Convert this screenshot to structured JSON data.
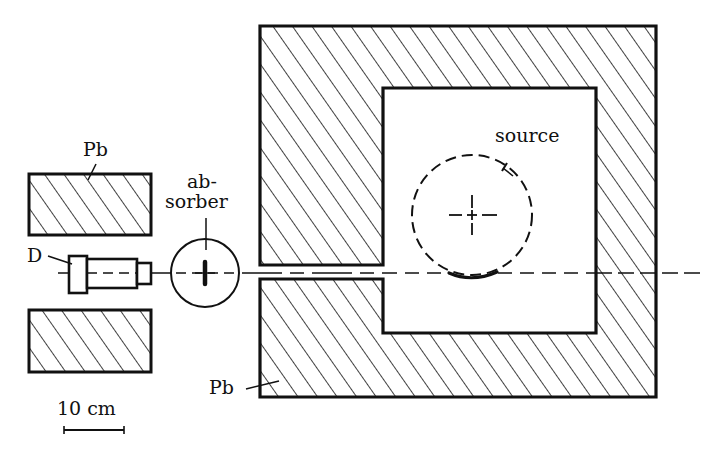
{
  "diagram": {
    "colors": {
      "ink": "#111111",
      "background": "#ffffff"
    },
    "labels": {
      "pb_left": "Pb",
      "pb_main": "Pb",
      "absorber_line1": "ab-",
      "absorber_line2": "sorber",
      "detector": "D",
      "source": "source",
      "scale": "10 cm"
    },
    "components": [
      {
        "id": "lead-block-upper-left",
        "material": "Pb"
      },
      {
        "id": "lead-block-lower-left",
        "material": "Pb"
      },
      {
        "id": "detector",
        "label": "D"
      },
      {
        "id": "absorber",
        "label": "absorber"
      },
      {
        "id": "lead-shield-main",
        "material": "Pb",
        "features": [
          "collimator slot",
          "source cavity"
        ]
      },
      {
        "id": "source",
        "label": "source"
      },
      {
        "id": "beam-axis",
        "style": "dashed"
      },
      {
        "id": "scale-bar",
        "length": "10 cm"
      }
    ]
  }
}
